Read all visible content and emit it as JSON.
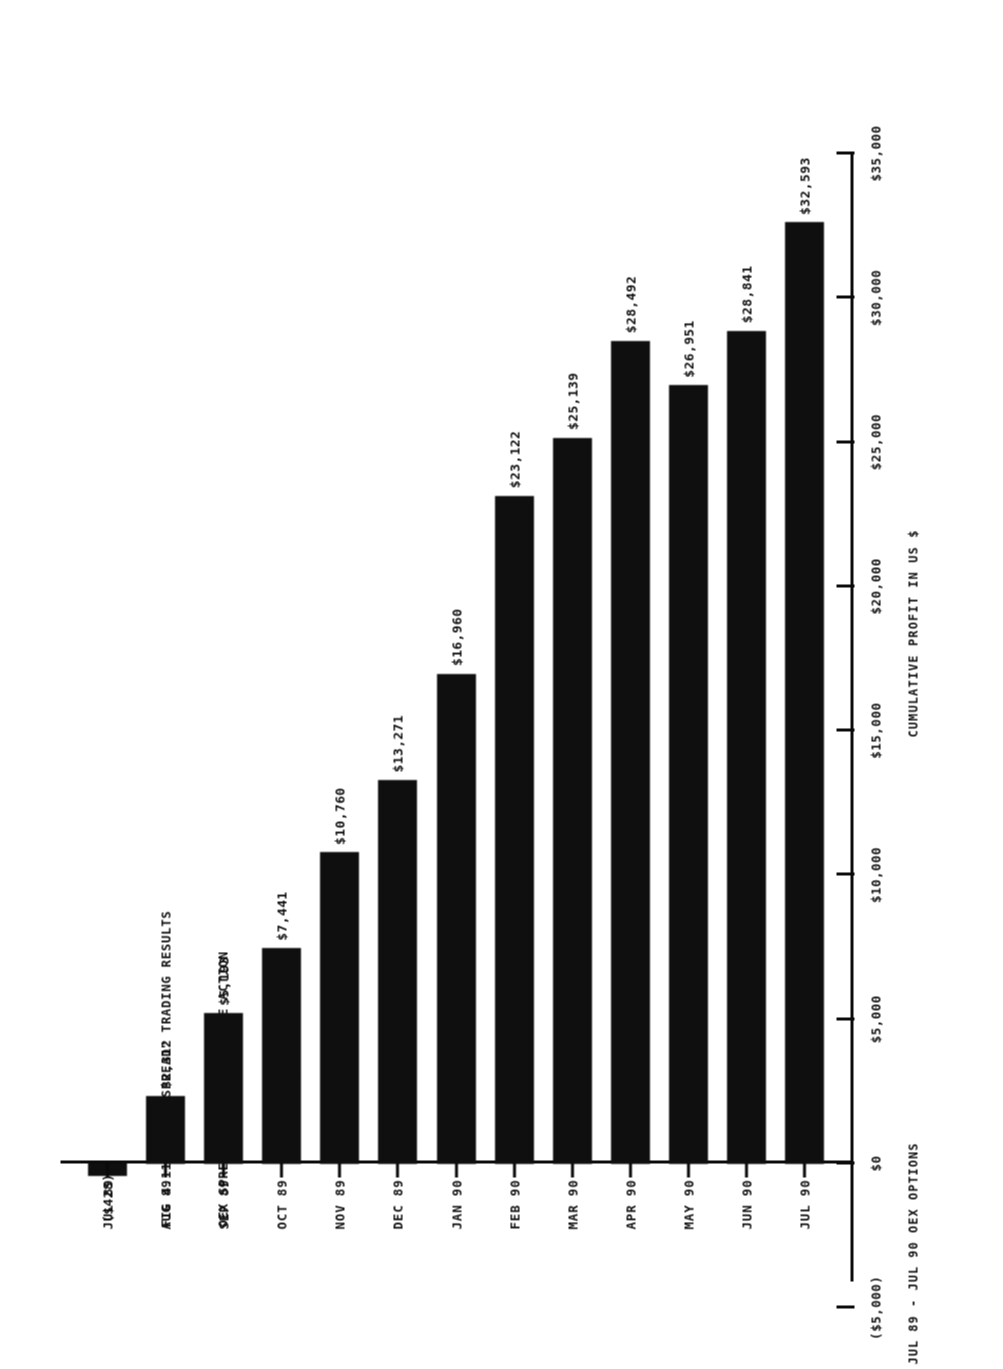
{
  "document": {
    "title_line1": "FIG 4.11 \"SHORT SPREAD\" TRADING RESULTS",
    "title_line2": "OEX SPREADS - NO PROTECTIVE ACTION"
  },
  "chart_data": {
    "type": "bar",
    "orientation": "horizontal",
    "title": "FIG 4.11 \"SHORT SPREAD\" TRADING RESULTS  OEX SPREADS - NO PROTECTIVE ACTION",
    "xlabel": "JUL 89 - JUL 90 OEX OPTIONS",
    "ylabel": "CUMULATIVE PROFIT IN US $",
    "categories": [
      "JUL 89",
      "AUG 89",
      "SEP 89",
      "OCT 89",
      "NOV 89",
      "DEC 89",
      "JAN 90",
      "FEB 90",
      "MAR 90",
      "APR 90",
      "MAY 90",
      "JUN 90",
      "JUL 90"
    ],
    "values": [
      -428,
      2312,
      5193,
      7441,
      10760,
      13271,
      16960,
      23122,
      25139,
      28492,
      26951,
      28841,
      32593
    ],
    "data_labels": [
      "($428)",
      "$2,312",
      "$5,193",
      "$7,441",
      "$10,760",
      "$13,271",
      "$16,960",
      "$23,122",
      "$25,139",
      "$28,492",
      "$26,951",
      "$28,841",
      "$32,593"
    ],
    "value_axis_ticks": [
      -5000,
      0,
      5000,
      10000,
      15000,
      20000,
      25000,
      30000,
      35000
    ],
    "value_axis_tick_labels": [
      "($5,000)",
      "$0",
      "$5,000",
      "$10,000",
      "$15,000",
      "$20,000",
      "$25,000",
      "$30,000",
      "$35,000"
    ],
    "ylim": [
      -5000,
      35000
    ],
    "grid": false,
    "legend": "none",
    "bar_color": "#151515"
  }
}
